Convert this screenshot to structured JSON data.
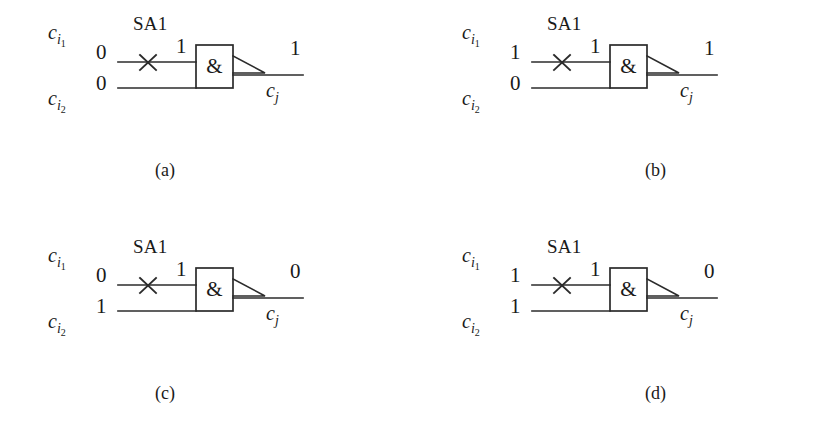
{
  "figure": {
    "type": "logic-circuit-fault-diagram",
    "gate_symbol": "&",
    "fault_label": "SA1",
    "fault_marker": "x-cross",
    "input_top_name": "c",
    "input_top_sub": "i",
    "input_top_sub2": "1",
    "input_bottom_name": "c",
    "input_bottom_sub": "i",
    "input_bottom_sub2": "2",
    "output_name": "c",
    "output_sub": "j",
    "line_color": "#2b2b2b",
    "text_color": "#1a1a1a",
    "background": "#ffffff"
  },
  "panels": [
    {
      "caption": "(a)",
      "caption_side": "left",
      "input_top_value": "0",
      "input_bottom_value": "0",
      "fault_value": "1",
      "output_value": "1",
      "fault_label": "SA1",
      "gate_symbol": "&"
    },
    {
      "caption": "(b)",
      "caption_side": "right",
      "input_top_value": "1",
      "input_bottom_value": "0",
      "fault_value": "1",
      "output_value": "1",
      "fault_label": "SA1",
      "gate_symbol": "&"
    },
    {
      "caption": "(c)",
      "caption_side": "left",
      "input_top_value": "0",
      "input_bottom_value": "1",
      "fault_value": "1",
      "output_value": "0",
      "fault_label": "SA1",
      "gate_symbol": "&"
    },
    {
      "caption": "(d)",
      "caption_side": "right",
      "input_top_value": "1",
      "input_bottom_value": "1",
      "fault_value": "1",
      "output_value": "0",
      "fault_label": "SA1",
      "gate_symbol": "&"
    }
  ]
}
